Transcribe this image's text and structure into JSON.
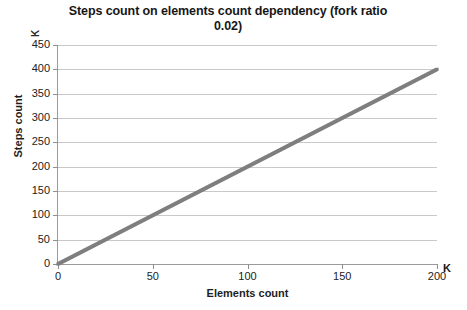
{
  "chart_data": {
    "type": "scatter",
    "title": "Steps count on elements count dependency (fork ratio 0.02)",
    "xlabel": "Elements count",
    "ylabel": "Steps count",
    "x_unit": "K",
    "y_unit": "K",
    "xlim": [
      0,
      200
    ],
    "ylim": [
      0,
      450
    ],
    "xticks": [
      0,
      50,
      100,
      150,
      200
    ],
    "yticks": [
      0,
      50,
      100,
      150,
      200,
      250,
      300,
      350,
      400,
      450
    ],
    "xtick_labels": [
      "0",
      "50",
      "100",
      "150",
      "200"
    ],
    "ytick_labels": [
      "0",
      "50",
      "100",
      "150",
      "200",
      "250",
      "300",
      "350",
      "400",
      "450"
    ],
    "grid": true,
    "grid_axis": "y",
    "legend": false,
    "marker_color": "#7f7f7f",
    "gridline_color": "#c9c9c9",
    "axis_color": "#9a9a9a",
    "series": [
      {
        "name": "Steps count",
        "relation": "y = 2x",
        "x": [
          0,
          2,
          4,
          6,
          8,
          10,
          12,
          14,
          16,
          18,
          20,
          22,
          24,
          26,
          28,
          30,
          32,
          34,
          36,
          38,
          40,
          42,
          44,
          46,
          48,
          50,
          52,
          54,
          56,
          58,
          60,
          62,
          64,
          66,
          68,
          70,
          72,
          74,
          76,
          78,
          80,
          82,
          84,
          86,
          88,
          90,
          92,
          94,
          96,
          98,
          100,
          102,
          104,
          106,
          108,
          110,
          112,
          114,
          116,
          118,
          120,
          122,
          124,
          126,
          128,
          130,
          132,
          134,
          136,
          138,
          140,
          142,
          144,
          146,
          148,
          150,
          152,
          154,
          156,
          158,
          160,
          162,
          164,
          166,
          168,
          170,
          172,
          174,
          176,
          178,
          180,
          182,
          184,
          186,
          188,
          190,
          192,
          194,
          196,
          198,
          200
        ],
        "y": [
          0,
          4,
          8,
          12,
          16,
          20,
          24,
          28,
          32,
          36,
          40,
          44,
          48,
          52,
          56,
          60,
          64,
          68,
          72,
          76,
          80,
          84,
          88,
          92,
          96,
          100,
          104,
          108,
          112,
          116,
          120,
          124,
          128,
          132,
          136,
          140,
          144,
          148,
          152,
          156,
          160,
          164,
          168,
          172,
          176,
          180,
          184,
          188,
          192,
          196,
          200,
          204,
          208,
          212,
          216,
          220,
          224,
          228,
          232,
          236,
          240,
          244,
          248,
          252,
          256,
          260,
          264,
          268,
          272,
          276,
          280,
          284,
          288,
          292,
          296,
          300,
          304,
          308,
          312,
          316,
          320,
          324,
          328,
          332,
          336,
          340,
          344,
          348,
          352,
          356,
          360,
          364,
          368,
          372,
          376,
          380,
          384,
          388,
          392,
          396,
          400
        ]
      }
    ]
  }
}
